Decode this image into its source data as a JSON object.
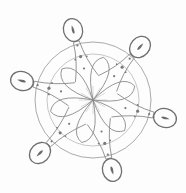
{
  "image": {
    "subject": "pencil sketch of a six-armed rangoli / kolam floral design",
    "background_color": "#fdfdfd",
    "stroke_color": "#8a8a8a",
    "dot_color": "#7a7a7a",
    "center": [
      93,
      100
    ],
    "arm_count": 6,
    "lamp_tips": [
      {
        "x": 73,
        "y": 30
      },
      {
        "x": 140,
        "y": 47
      },
      {
        "x": 165,
        "y": 118
      },
      {
        "x": 112,
        "y": 170
      },
      {
        "x": 40,
        "y": 153
      },
      {
        "x": 22,
        "y": 81
      }
    ]
  }
}
